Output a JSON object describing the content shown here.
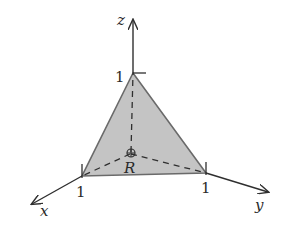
{
  "diagram": {
    "colors": {
      "background": "#ffffff",
      "axis": "#2f2f2f",
      "fill": "#c4c4c4",
      "edge": "#6a6a6a"
    },
    "axes": {
      "x": {
        "label": "x",
        "tick_label": "1"
      },
      "y": {
        "label": "y",
        "tick_label": "1"
      },
      "z": {
        "label": "z",
        "tick_label": "1"
      }
    },
    "region": {
      "label": "R",
      "vertices": [
        "(1,0,0)",
        "(0,1,0)",
        "(0,0,1)"
      ]
    }
  }
}
